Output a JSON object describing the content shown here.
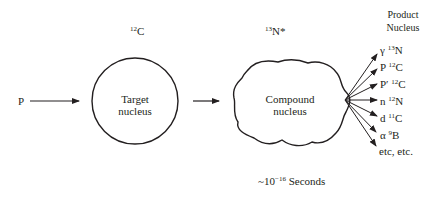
{
  "diagram": {
    "projectile": {
      "label": "P"
    },
    "target": {
      "isotope_mass": "12",
      "isotope_symbol": "C",
      "label_line1": "Target",
      "label_line2": "nucleus"
    },
    "compound": {
      "isotope_mass": "13",
      "isotope_symbol": "N*",
      "label_line1": "Compound",
      "label_line2": "nucleus",
      "lifetime_prefix": "~10",
      "lifetime_exponent": "−16",
      "lifetime_unit": "Seconds"
    },
    "products": {
      "header_line1": "Product",
      "header_line2": "Nucleus",
      "items": [
        {
          "particle": "γ",
          "mass": "13",
          "symbol": "N"
        },
        {
          "particle": "P",
          "mass": "12",
          "symbol": "C"
        },
        {
          "particle": "P′",
          "mass": "12",
          "symbol": "C"
        },
        {
          "particle": "n",
          "mass": "12",
          "symbol": "N"
        },
        {
          "particle": "d",
          "mass": "11",
          "symbol": "C"
        },
        {
          "particle": "α",
          "mass": "9",
          "symbol": "B"
        }
      ],
      "footer": "etc, etc."
    },
    "colors": {
      "ink": "#231f20",
      "background": "#ffffff"
    }
  }
}
